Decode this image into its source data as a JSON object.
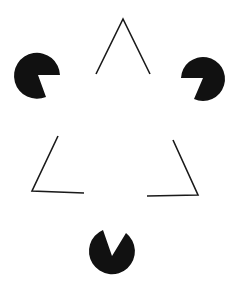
{
  "figure": {
    "background": "#ffffff",
    "ink": "#111111",
    "pacmen": [
      {
        "name": "left",
        "cx": 38,
        "cy": 75,
        "r": 23
      },
      {
        "name": "right",
        "cx": 203,
        "cy": 78,
        "r": 22
      },
      {
        "name": "bottom",
        "cx": 112,
        "cy": 250,
        "r": 23
      }
    ],
    "line_segments": [
      {
        "name": "top-v",
        "points": "96,74 123,19 150,74"
      },
      {
        "name": "bottom-left-corner",
        "points": "58,136 32,191 84,193"
      },
      {
        "name": "bottom-right-corner",
        "points": "173,140 198,195 147,196"
      }
    ]
  }
}
